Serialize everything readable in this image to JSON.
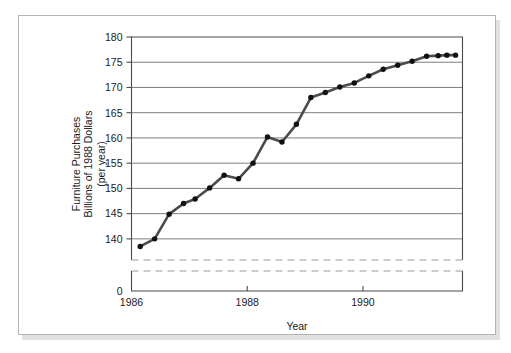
{
  "figure": {
    "background_color": "#ffffff",
    "page_border_color": "#b5b5b5",
    "shadow_color": "#c9c9c9"
  },
  "chart_data": {
    "type": "line",
    "title": "",
    "xlabel": "Year",
    "ylabel": "Furniture Purchases Billions of 1988 Dollars (per year)",
    "ylabel_lines": [
      "Furniture Purchases",
      "Billions of 1988 Dollars",
      "(per year)"
    ],
    "x": [
      1986.15,
      1986.4,
      1986.65,
      1986.9,
      1987.1,
      1987.35,
      1987.6,
      1987.85,
      1988.1,
      1988.35,
      1988.6,
      1988.85,
      1989.1,
      1989.35,
      1989.6,
      1989.85,
      1990.1,
      1990.35,
      1990.6,
      1990.85,
      1991.1,
      1991.3,
      1991.45,
      1991.6
    ],
    "values": [
      138.5,
      140.0,
      144.9,
      147.0,
      147.9,
      150.1,
      152.6,
      151.9,
      155.0,
      160.2,
      159.2,
      162.7,
      168.0,
      169.0,
      170.1,
      170.9,
      172.3,
      173.6,
      174.4,
      175.2,
      176.2,
      176.3,
      176.4,
      176.4
    ],
    "yticks": [
      140,
      145,
      150,
      155,
      160,
      165,
      170,
      175,
      180
    ],
    "ytick_labels": [
      "140",
      "145",
      "150",
      "155",
      "160",
      "165",
      "170",
      "175",
      "180"
    ],
    "y_zero_label": "0",
    "xticks": [
      1986,
      1988,
      1990
    ],
    "xtick_labels": [
      "1986",
      "1988",
      "1990"
    ],
    "ylim": [
      137.2,
      180
    ],
    "xlim": [
      1986,
      1991.72
    ],
    "axis_break": true,
    "grid": true,
    "grid_axis": "y",
    "legend": "none",
    "line_color": "#4a4a50",
    "marker_color": "#111111",
    "marker_shape": "circle",
    "grid_color": "#6f6f6f",
    "axis_color": "#4a4a4a",
    "break_line_color": "#9a9a9a"
  }
}
